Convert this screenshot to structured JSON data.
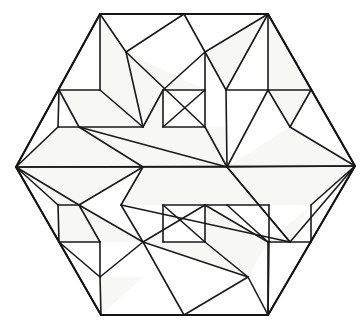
{
  "figure": {
    "shape_type": "hexagon",
    "symmetry": "180-degree rotational (point symmetry about center)",
    "background_color": "#ffffff",
    "line_color": "#1a1a1a",
    "face_fill_color": "#f7f7f6",
    "face_fill_alt_color": "#ffffff",
    "line_width": 1.6,
    "outline_width": 2.0,
    "canvas": {
      "width": 360,
      "height": 329
    },
    "center": {
      "x": 185,
      "y": 166
    }
  },
  "hexagon": {
    "name": "outer-hexagon",
    "vertices": [
      {
        "label": "top-left",
        "x": 100,
        "y": 14
      },
      {
        "label": "top-right",
        "x": 268,
        "y": 14
      },
      {
        "label": "right",
        "x": 355,
        "y": 166
      },
      {
        "label": "bottom-right",
        "x": 268,
        "y": 315
      },
      {
        "label": "bottom-left",
        "x": 101,
        "y": 315
      },
      {
        "label": "left",
        "x": 16,
        "y": 167
      }
    ]
  },
  "points": {
    "HTL": {
      "x": 100,
      "y": 14
    },
    "HTR": {
      "x": 268,
      "y": 14
    },
    "HR": {
      "x": 355,
      "y": 166
    },
    "HBR": {
      "x": 268,
      "y": 315
    },
    "HBL": {
      "x": 101,
      "y": 315
    },
    "HL": {
      "x": 16,
      "y": 167
    },
    "TM": {
      "x": 184,
      "y": 14
    },
    "BM": {
      "x": 184,
      "y": 315
    },
    "A": {
      "x": 100,
      "y": 90
    },
    "B": {
      "x": 59,
      "y": 90
    },
    "C": {
      "x": 143,
      "y": 127
    },
    "D": {
      "x": 58,
      "y": 127
    },
    "E": {
      "x": 79,
      "y": 127
    },
    "F": {
      "x": 126,
      "y": 52
    },
    "G": {
      "x": 205,
      "y": 52
    },
    "H": {
      "x": 205,
      "y": 90
    },
    "I": {
      "x": 163,
      "y": 90
    },
    "J": {
      "x": 163,
      "y": 127
    },
    "K": {
      "x": 205,
      "y": 127
    },
    "L": {
      "x": 226,
      "y": 90
    },
    "M": {
      "x": 268,
      "y": 90
    },
    "N": {
      "x": 311,
      "y": 90
    },
    "O": {
      "x": 290,
      "y": 127
    },
    "P": {
      "x": 143,
      "y": 167
    },
    "Q": {
      "x": 227,
      "y": 167
    },
    "R": {
      "x": 227,
      "y": 205
    },
    "S": {
      "x": 269,
      "y": 205
    },
    "T": {
      "x": 290,
      "y": 242
    },
    "U": {
      "x": 311,
      "y": 242
    },
    "V": {
      "x": 269,
      "y": 242
    },
    "W": {
      "x": 163,
      "y": 205
    },
    "X": {
      "x": 205,
      "y": 205
    },
    "Y": {
      "x": 163,
      "y": 242
    },
    "Z": {
      "x": 205,
      "y": 242
    },
    "AA": {
      "x": 143,
      "y": 242
    },
    "AB": {
      "x": 100,
      "y": 242
    },
    "AC": {
      "x": 79,
      "y": 205
    },
    "AD": {
      "x": 121,
      "y": 205
    },
    "AE": {
      "x": 58,
      "y": 205
    },
    "AF": {
      "x": 59,
      "y": 242
    },
    "AG": {
      "x": 100,
      "y": 277
    },
    "AH": {
      "x": 268,
      "y": 242
    },
    "AI": {
      "x": 248,
      "y": 277
    },
    "AJ": {
      "x": 311,
      "y": 205
    }
  },
  "faces": [
    {
      "name": "face-tl-wedge-outer",
      "fill": "#ffffff",
      "points": "100,14 100,90 59,90"
    },
    {
      "name": "face-tl-wedge-inner",
      "fill": "#f7f7f6",
      "points": "100,14 126,52 100,90"
    },
    {
      "name": "face-tl-kite",
      "fill": "#f7f7f6",
      "points": "126,52 205,90 143,127 100,90"
    },
    {
      "name": "face-tl-lower-strip",
      "fill": "#f7f7f6",
      "points": "59,90 100,90 143,127 79,127"
    },
    {
      "name": "face-tl-small-tri",
      "fill": "#ffffff",
      "points": "59,90 79,127 58,127"
    },
    {
      "name": "face-top-center-peak",
      "fill": "#ffffff",
      "points": "126,52 184,14 205,52"
    },
    {
      "name": "face-top-center-box",
      "fill": "#ffffff",
      "points": "163,90 205,90 205,127 163,127"
    },
    {
      "name": "face-tc-zig-1",
      "fill": "#f7f7f6",
      "points": "163,90 163,127 143,127"
    },
    {
      "name": "face-tr-fan-a",
      "fill": "#f7f7f6",
      "points": "205,52 268,14 226,90"
    },
    {
      "name": "face-tr-fan-b",
      "fill": "#ffffff",
      "points": "205,52 226,90 205,90"
    },
    {
      "name": "face-tr-tri-1",
      "fill": "#ffffff",
      "points": "268,14 226,90 268,90"
    },
    {
      "name": "face-tr-tri-2",
      "fill": "#f7f7f6",
      "points": "268,14 268,90 311,90"
    },
    {
      "name": "face-tr-tri-3",
      "fill": "#ffffff",
      "points": "226,90 268,90 248,127"
    },
    {
      "name": "face-tr-tri-4",
      "fill": "#f7f7f6",
      "points": "268,90 311,90 290,127"
    },
    {
      "name": "face-band-upper",
      "fill": "#f7f7f6",
      "points": "79,127 227,127 227,167 143,167"
    },
    {
      "name": "face-band-lower",
      "fill": "#f7f7f6",
      "points": "143,167 227,167 290,205 121,205"
    },
    {
      "name": "face-left-upper",
      "fill": "#f7f7f6",
      "points": "16,167 58,127 79,127 143,167"
    },
    {
      "name": "face-left-lower",
      "fill": "#f7f7f6",
      "points": "16,167 143,167 79,205 58,205"
    },
    {
      "name": "face-right-upper",
      "fill": "#f7f7f6",
      "points": "227,167 290,127 355,166"
    },
    {
      "name": "face-right-lower",
      "fill": "#f7f7f6",
      "points": "227,167 355,166 311,205 290,205"
    },
    {
      "name": "face-bl-wedge",
      "fill": "#f7f7f6",
      "points": "79,205 143,242 100,242"
    },
    {
      "name": "face-bl-strip",
      "fill": "#f7f7f6",
      "points": "58,205 79,205 100,242 59,242"
    },
    {
      "name": "face-bc-kite",
      "fill": "#f7f7f6",
      "points": "143,242 205,205 268,242 248,277"
    },
    {
      "name": "face-bc-box",
      "fill": "#ffffff",
      "points": "163,205 205,205 205,242 163,242"
    },
    {
      "name": "face-bottom-peak",
      "fill": "#ffffff",
      "points": "163,277 184,315 205,277"
    },
    {
      "name": "face-br-tri-1",
      "fill": "#f7f7f6",
      "points": "268,242 311,205 290,242"
    },
    {
      "name": "face-br-tri-2",
      "fill": "#f7f7f6",
      "points": "101,315 100,277 143,277"
    }
  ],
  "edges": [
    {
      "name": "outline-top",
      "from": "HTL",
      "to": "HTR"
    },
    {
      "name": "outline-upper-right",
      "from": "HTR",
      "to": "HR"
    },
    {
      "name": "outline-lower-right",
      "from": "HR",
      "to": "HBR"
    },
    {
      "name": "outline-bottom",
      "from": "HBR",
      "to": "HBL"
    },
    {
      "name": "outline-lower-left",
      "from": "HBL",
      "to": "HL"
    },
    {
      "name": "outline-upper-left",
      "from": "HL",
      "to": "HTL"
    },
    {
      "name": "tl-vertical",
      "from": "HTL",
      "to": "A"
    },
    {
      "name": "tl-to-topcorner-left",
      "from": "HTL",
      "to": "F"
    },
    {
      "name": "tl-peak-to-mid",
      "from": "F",
      "to": "TM"
    },
    {
      "name": "tl-diag-down",
      "from": "F",
      "to": "C"
    },
    {
      "name": "tl-kite-long",
      "from": "F",
      "to": "K"
    },
    {
      "name": "tl-horiz-a",
      "from": "B",
      "to": "A"
    },
    {
      "name": "tl-a-to-c",
      "from": "A",
      "to": "C"
    },
    {
      "name": "tl-b-to-e",
      "from": "B",
      "to": "E"
    },
    {
      "name": "tl-b-to-d",
      "from": "B",
      "to": "D"
    },
    {
      "name": "tl-horiz-lower",
      "from": "E",
      "to": "C"
    },
    {
      "name": "tl-d-e-horiz",
      "from": "D",
      "to": "E"
    },
    {
      "name": "tc-peak-right",
      "from": "TM",
      "to": "G"
    },
    {
      "name": "tc-g-vertical-left",
      "from": "G",
      "to": "I"
    },
    {
      "name": "tc-g-vertical-right",
      "from": "G",
      "to": "H"
    },
    {
      "name": "tc-h-i-horiz",
      "from": "I",
      "to": "H"
    },
    {
      "name": "tc-i-vertical",
      "from": "I",
      "to": "J"
    },
    {
      "name": "tc-h-vertical",
      "from": "H",
      "to": "K"
    },
    {
      "name": "tc-i-to-c",
      "from": "I",
      "to": "C"
    },
    {
      "name": "tc-j-k-horiz",
      "from": "J",
      "to": "K"
    },
    {
      "name": "tc-h-to-j",
      "from": "H",
      "to": "J"
    },
    {
      "name": "tr-g-to-corner",
      "from": "G",
      "to": "HTR"
    },
    {
      "name": "tr-g-to-l",
      "from": "G",
      "to": "L"
    },
    {
      "name": "tr-corner-to-l",
      "from": "HTR",
      "to": "L"
    },
    {
      "name": "tr-corner-to-m",
      "from": "HTR",
      "to": "M"
    },
    {
      "name": "tr-l-m-horiz",
      "from": "L",
      "to": "M"
    },
    {
      "name": "tr-m-n-horiz",
      "from": "M",
      "to": "N"
    },
    {
      "name": "tr-l-to-q",
      "from": "L",
      "to": "Q"
    },
    {
      "name": "tr-m-to-q",
      "from": "M",
      "to": "Q"
    },
    {
      "name": "tr-n-to-o",
      "from": "N",
      "to": "O"
    },
    {
      "name": "tr-m-to-o",
      "from": "M",
      "to": "O"
    },
    {
      "name": "band-upper-left-edge",
      "from": "E",
      "to": "P"
    },
    {
      "name": "band-top-horiz",
      "from": "E",
      "to": "Q"
    },
    {
      "name": "band-mid-horiz",
      "from": "HL",
      "to": "HR"
    },
    {
      "name": "band-q-vertical",
      "from": "Q",
      "to": "K"
    },
    {
      "name": "band-p-to-q",
      "from": "P",
      "to": "Q"
    },
    {
      "name": "band-lower-horiz",
      "from": "AD",
      "to": "T"
    },
    {
      "name": "band-lower-left-edge",
      "from": "P",
      "to": "AD"
    },
    {
      "name": "band-lower-right-edge",
      "from": "Q",
      "to": "T"
    },
    {
      "name": "left-upper-a",
      "from": "HL",
      "to": "D"
    },
    {
      "name": "left-upper-b",
      "from": "HL",
      "to": "P"
    },
    {
      "name": "left-lower-a",
      "from": "HL",
      "to": "AE"
    },
    {
      "name": "left-lower-b",
      "from": "HL",
      "to": "AC"
    },
    {
      "name": "left-ac-to-p",
      "from": "AC",
      "to": "P"
    },
    {
      "name": "right-upper-a",
      "from": "HR",
      "to": "O"
    },
    {
      "name": "right-upper-b",
      "from": "HR",
      "to": "Q"
    },
    {
      "name": "right-lower-a",
      "from": "HR",
      "to": "AJ"
    },
    {
      "name": "right-lower-b",
      "from": "HR",
      "to": "T"
    },
    {
      "name": "right-t-to-q",
      "from": "T",
      "to": "Q"
    },
    {
      "name": "bl-ae-ac-horiz",
      "from": "AE",
      "to": "AC"
    },
    {
      "name": "bl-ac-to-aa",
      "from": "AC",
      "to": "AA"
    },
    {
      "name": "bl-ac-to-ab",
      "from": "AC",
      "to": "AB"
    },
    {
      "name": "bl-ae-to-af",
      "from": "AE",
      "to": "AF"
    },
    {
      "name": "bl-af-ab-horiz",
      "from": "AF",
      "to": "AB"
    },
    {
      "name": "bl-af-to-ag",
      "from": "AF",
      "to": "AG"
    },
    {
      "name": "bl-ab-to-ag",
      "from": "AB",
      "to": "AG"
    },
    {
      "name": "bl-ag-to-corner",
      "from": "AG",
      "to": "HBL"
    },
    {
      "name": "bl-ag-to-aa",
      "from": "AG",
      "to": "AA"
    },
    {
      "name": "bl-corner-to-bm",
      "from": "HBL",
      "to": "BM"
    },
    {
      "name": "bc-aa-vertical",
      "from": "AA",
      "to": "AD"
    },
    {
      "name": "bc-aa-to-x",
      "from": "AA",
      "to": "X"
    },
    {
      "name": "bc-w-x-horiz",
      "from": "W",
      "to": "X"
    },
    {
      "name": "bc-w-vertical",
      "from": "W",
      "to": "Y"
    },
    {
      "name": "bc-x-vertical",
      "from": "X",
      "to": "Z"
    },
    {
      "name": "bc-y-z-horiz",
      "from": "Y",
      "to": "Z"
    },
    {
      "name": "bc-w-to-z",
      "from": "W",
      "to": "Z"
    },
    {
      "name": "bc-aa-to-bm",
      "from": "AA",
      "to": "BM"
    },
    {
      "name": "bc-x-to-ah",
      "from": "X",
      "to": "AH"
    },
    {
      "name": "bc-z-to-ai",
      "from": "Z",
      "to": "AI"
    },
    {
      "name": "bc-ai-to-bm",
      "from": "AI",
      "to": "BM"
    },
    {
      "name": "bc-aa-to-ai",
      "from": "AA",
      "to": "AI"
    },
    {
      "name": "br-r-to-x",
      "from": "R",
      "to": "X"
    },
    {
      "name": "br-r-to-s",
      "from": "R",
      "to": "S"
    },
    {
      "name": "br-r-to-ah",
      "from": "R",
      "to": "AH"
    },
    {
      "name": "br-s-vertical",
      "from": "S",
      "to": "V"
    },
    {
      "name": "br-ah-v-horiz",
      "from": "AH",
      "to": "V"
    },
    {
      "name": "br-t-u-horiz",
      "from": "T",
      "to": "U"
    },
    {
      "name": "br-ah-to-t",
      "from": "AH",
      "to": "T"
    },
    {
      "name": "br-aj-to-u",
      "from": "AJ",
      "to": "U"
    },
    {
      "name": "br-ah-to-corner",
      "from": "AH",
      "to": "HBR"
    },
    {
      "name": "br-ai-to-corner",
      "from": "AI",
      "to": "HBR"
    },
    {
      "name": "br-v-vertical-corner",
      "from": "V",
      "to": "HBR"
    }
  ]
}
